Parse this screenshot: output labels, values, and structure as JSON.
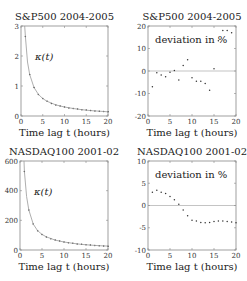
{
  "chart_data": [
    {
      "id": "sp500-kappa",
      "type": "line",
      "title": "S&P500 2004-2005",
      "xlabel": "Time lag t (hours)",
      "ylabel": "",
      "annotation": "κ(t)",
      "xlim": [
        0,
        20
      ],
      "ylim": [
        0,
        3
      ],
      "xticks": [
        0,
        5,
        10,
        15,
        20
      ],
      "yticks": [
        0,
        1,
        2,
        3
      ],
      "grid": false,
      "frame": {
        "x0": 21,
        "x1": 108,
        "y0": 26,
        "y1": 116
      },
      "series": [
        {
          "name": "data points",
          "style": "markers",
          "x": [
            1,
            2,
            3,
            4,
            5,
            6,
            7,
            8,
            9,
            10,
            11,
            12,
            13,
            14,
            15,
            16,
            17,
            18,
            19,
            20
          ],
          "y": [
            2.65,
            1.38,
            0.95,
            0.72,
            0.58,
            0.49,
            0.42,
            0.37,
            0.33,
            0.3,
            0.27,
            0.25,
            0.23,
            0.21,
            0.2,
            0.18,
            0.17,
            0.16,
            0.15,
            0.14
          ]
        },
        {
          "name": "fit",
          "style": "line",
          "x": [
            0.85,
            1,
            1.5,
            2,
            3,
            4,
            5,
            6,
            8,
            10,
            12,
            14,
            16,
            18,
            20
          ],
          "y": [
            3.0,
            2.65,
            1.8,
            1.38,
            0.95,
            0.72,
            0.58,
            0.49,
            0.37,
            0.3,
            0.25,
            0.21,
            0.18,
            0.16,
            0.14
          ]
        }
      ]
    },
    {
      "id": "sp500-deviation",
      "type": "scatter",
      "title": "S&P500 2004-2005",
      "xlabel": "Time lag t (hours)",
      "annotation": "deviation in %",
      "xlim": [
        0,
        20
      ],
      "ylim": [
        -20,
        20
      ],
      "xticks": [
        0,
        5,
        10,
        15,
        20
      ],
      "yticks": [
        -20,
        -10,
        0,
        10,
        20
      ],
      "hline": 0,
      "grid": false,
      "frame": {
        "x0": 148,
        "x1": 236,
        "y0": 26,
        "y1": 116
      },
      "series": [
        {
          "name": "deviation",
          "x": [
            1,
            2,
            3,
            4,
            5,
            6,
            7,
            8,
            9,
            10,
            11,
            12,
            13,
            14,
            15,
            16,
            17,
            18,
            19
          ],
          "y": [
            -7,
            -0.8,
            -1.8,
            -2.5,
            -0.5,
            0.2,
            -4,
            2.5,
            5,
            -3,
            -4.5,
            -4.5,
            -5.5,
            -8.5,
            1,
            13.5,
            18,
            18,
            17
          ]
        }
      ]
    },
    {
      "id": "nasdaq-kappa",
      "type": "line",
      "title": "NASDAQ100 2001-02",
      "xlabel": "Time lag t (hours)",
      "annotation": "κ(t)",
      "xlim": [
        0,
        20
      ],
      "ylim": [
        0,
        600
      ],
      "xticks": [
        0,
        5,
        10,
        15,
        20
      ],
      "yticks": [
        0,
        200,
        400,
        600
      ],
      "grid": false,
      "frame": {
        "x0": 20,
        "x1": 108,
        "y0": 161,
        "y1": 250
      },
      "series": [
        {
          "name": "data points",
          "style": "markers",
          "x": [
            1,
            2,
            3,
            4,
            5,
            6,
            7,
            8,
            9,
            10,
            11,
            12,
            13,
            14,
            15,
            16,
            17,
            18,
            19,
            20
          ],
          "y": [
            530,
            270,
            175,
            130,
            105,
            88,
            76,
            67,
            60,
            54,
            49,
            45,
            41,
            38,
            35,
            33,
            31,
            29,
            27,
            26
          ]
        },
        {
          "name": "fit",
          "style": "line",
          "x": [
            0.9,
            1,
            1.5,
            2,
            3,
            4,
            5,
            6,
            8,
            10,
            12,
            14,
            16,
            18,
            20
          ],
          "y": [
            600,
            530,
            360,
            270,
            175,
            130,
            105,
            88,
            67,
            54,
            45,
            38,
            33,
            29,
            26
          ]
        }
      ]
    },
    {
      "id": "nasdaq-deviation",
      "type": "scatter",
      "title": "NASDAQ100 2001-02",
      "xlabel": "Time lag t (hours)",
      "annotation": "deviation in %",
      "xlim": [
        0,
        20
      ],
      "ylim": [
        -10,
        10
      ],
      "xticks": [
        0,
        5,
        10,
        15,
        20
      ],
      "yticks": [
        -10,
        -5,
        0,
        5,
        10
      ],
      "hline": 0,
      "grid": false,
      "frame": {
        "x0": 148,
        "x1": 236,
        "y0": 161,
        "y1": 250
      },
      "series": [
        {
          "name": "deviation",
          "x": [
            1,
            2,
            3,
            4,
            5,
            6,
            7,
            8,
            9,
            10,
            11,
            12,
            13,
            14,
            15,
            16,
            17,
            18,
            19,
            20
          ],
          "y": [
            3,
            3.4,
            3,
            2.7,
            2,
            1.3,
            0.3,
            -1,
            -2.3,
            -3.3,
            -3.5,
            -3.8,
            -3.9,
            -3.8,
            -3.6,
            -3.5,
            -3.5,
            -3.6,
            -3.7,
            -3.9
          ]
        }
      ]
    }
  ]
}
